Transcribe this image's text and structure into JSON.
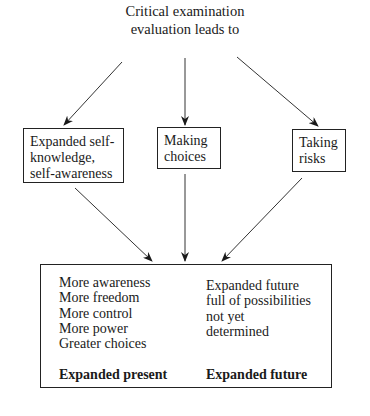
{
  "title": {
    "line1": "Critical examination",
    "line2": "evaluation leads to"
  },
  "boxes": [
    {
      "id": "self-knowledge",
      "lines": [
        "Expanded self-",
        "knowledge,",
        "self-awareness"
      ]
    },
    {
      "id": "making-choices",
      "lines": [
        "Making",
        "choices"
      ]
    },
    {
      "id": "taking-risks",
      "lines": [
        "Taking",
        "risks"
      ]
    }
  ],
  "outcome": {
    "present": {
      "items": [
        "More awareness",
        "More freedom",
        "More control",
        "More power",
        "Greater choices"
      ],
      "heading": "Expanded present"
    },
    "future": {
      "items": [
        "Expanded future",
        "full of possibilities",
        "not yet",
        "determined"
      ],
      "heading": "Expanded future"
    }
  }
}
